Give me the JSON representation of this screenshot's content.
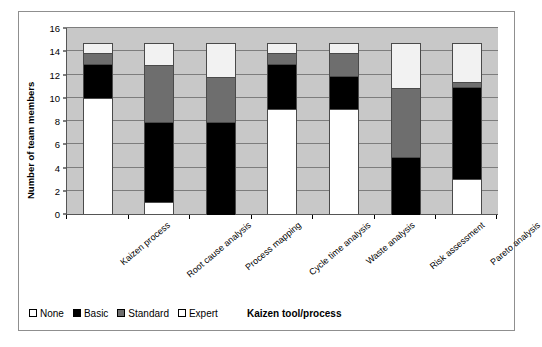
{
  "chart_data": {
    "type": "bar",
    "subtype": "stacked-vertical",
    "title": "",
    "xlabel": "Kaizen tool/process",
    "ylabel": "Number of team members",
    "ylim": [
      0,
      16
    ],
    "yticks": [
      0,
      2,
      4,
      6,
      8,
      10,
      12,
      14,
      16
    ],
    "grid": true,
    "legend_position": "bottom-left",
    "categories": [
      "Kaizen process",
      "Root cause analysis",
      "Process mapping",
      "Cycle time  analysis",
      "Waste analysis",
      "Risk assessment",
      "Pareto analysis"
    ],
    "series": [
      {
        "name": "None",
        "color": "#ffffff",
        "values": [
          10,
          1,
          0,
          9,
          9,
          0,
          3
        ]
      },
      {
        "name": "Basic",
        "color": "#000000",
        "values": [
          3,
          7,
          8,
          4,
          3,
          5,
          8
        ]
      },
      {
        "name": "Standard",
        "color": "#6e6e6e",
        "values": [
          1,
          5,
          4,
          1,
          2,
          6,
          0.5
        ]
      },
      {
        "name": "Expert",
        "color": "#f2f2f2",
        "values": [
          1,
          2,
          3,
          1,
          1,
          4,
          3.5
        ]
      }
    ],
    "stack_totals": [
      15,
      15,
      15,
      15,
      15,
      15,
      15
    ]
  },
  "axis": {
    "y_title": "Number of team members",
    "x_title": "Kaizen tool/process",
    "y_tick_labels": [
      "0",
      "2",
      "4",
      "6",
      "8",
      "10",
      "12",
      "14",
      "16"
    ]
  },
  "legend": {
    "items": [
      {
        "label": "None",
        "swatch": "none"
      },
      {
        "label": "Basic",
        "swatch": "basic"
      },
      {
        "label": "Standard",
        "swatch": "standard"
      },
      {
        "label": "Expert",
        "swatch": "expert"
      }
    ]
  },
  "colors": {
    "plot_background": "#c8c8c8",
    "gridline": "#7d7d7d",
    "axis": "#555555",
    "frame": "#8f8f8f",
    "none": "#ffffff",
    "basic": "#000000",
    "standard": "#6e6e6e",
    "expert": "#f2f2f2"
  }
}
